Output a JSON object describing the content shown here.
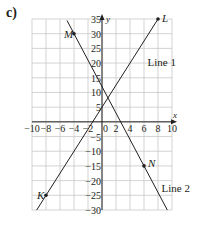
{
  "part_label": "c)",
  "chart_data": {
    "type": "line",
    "title": "",
    "xlabel": "x",
    "ylabel": "y",
    "xlim": [
      -10,
      10
    ],
    "ylim": [
      -30,
      35
    ],
    "grid": true,
    "x_ticks": [
      -10,
      -8,
      -6,
      -4,
      -2,
      0,
      2,
      4,
      6,
      8,
      10
    ],
    "x_tick_labels": [
      "−10",
      "−8",
      "−6",
      "−4",
      "−2",
      "0",
      "2",
      "4",
      "6",
      "8",
      "10"
    ],
    "y_ticks": [
      35,
      30,
      25,
      20,
      15,
      10,
      5,
      -5,
      -10,
      -15,
      -20,
      -25,
      -30
    ],
    "y_tick_labels": [
      "35",
      "30",
      "25",
      "20",
      "15",
      "10",
      "5",
      "−5",
      "−10",
      "−15",
      "−20",
      "−25",
      "−30"
    ],
    "series": [
      {
        "name": "Line 1",
        "slope": 3.75,
        "intercept": 5,
        "x": [
          -9.33,
          8
        ],
        "y": [
          -30,
          35
        ],
        "label_pos": [
          6.5,
          19
        ]
      },
      {
        "name": "Line 2",
        "slope": -4.5,
        "intercept": 12,
        "x": [
          -5,
          9.33
        ],
        "y": [
          34.5,
          -30
        ],
        "label_pos": [
          8.5,
          -24
        ]
      }
    ],
    "points": [
      {
        "label": "M",
        "x": -4,
        "y": 30
      },
      {
        "label": "L",
        "x": 8,
        "y": 35
      },
      {
        "label": "K",
        "x": -8,
        "y": -25
      },
      {
        "label": "N",
        "x": 6,
        "y": -15
      }
    ]
  },
  "colors": {
    "ink": "#231f20",
    "grid": "#c8c8c8"
  }
}
